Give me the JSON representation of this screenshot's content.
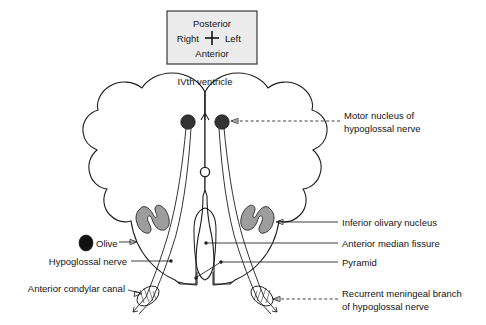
{
  "figure": {
    "compass": {
      "posterior": "Posterior",
      "right": "Right",
      "left": "Left",
      "anterior": "Anterior",
      "box_fill": "#ebebeb",
      "box_border": "#3a3a3a"
    },
    "labels": {
      "ivth_ventricle": "IVth ventricle",
      "motor_nucleus_line1": "Motor nucleus of",
      "motor_nucleus_line2": "hypoglossal nerve",
      "inferior_olivary_nucleus": "Inferior olivary nucleus",
      "anterior_median_fissure": "Anterior median fissure",
      "pyramid": "Pyramid",
      "recurrent_line1": "Recurrent meningeal branch",
      "recurrent_line2": "of hypoglossal nerve",
      "olive": "Olive",
      "hypoglossal_nerve": "Hypoglossal nerve",
      "anterior_condylar_canal": "Anterior condylar canal"
    },
    "colors": {
      "stroke": "#1d1d1d",
      "motor_nucleus_fill": "#333333",
      "olivary_nucleus_fill": "#9d9d9d",
      "olive_marker_fill": "#111111",
      "background": "#ffffff"
    }
  }
}
